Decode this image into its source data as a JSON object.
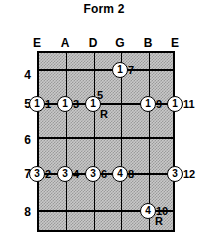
{
  "title": "Form 2",
  "diagram": {
    "type": "guitar-fretboard",
    "strings": [
      {
        "label": "E",
        "x": 37
      },
      {
        "label": "A",
        "x": 65
      },
      {
        "label": "D",
        "x": 93
      },
      {
        "label": "G",
        "x": 120
      },
      {
        "label": "B",
        "x": 148
      },
      {
        "label": "E",
        "x": 175
      }
    ],
    "frets": [
      {
        "number": "4",
        "y": 75
      },
      {
        "number": "5",
        "y": 104
      },
      {
        "number": "6",
        "y": 140
      },
      {
        "number": "7",
        "y": 174
      },
      {
        "number": "8",
        "y": 212
      }
    ],
    "fret_line_y": [
      16,
      50,
      84,
      120,
      157
    ],
    "markers": [
      {
        "finger": "1",
        "degree": "7",
        "string": 3,
        "fret": "4",
        "x": 120,
        "y": 70,
        "root": false
      },
      {
        "finger": "1",
        "degree": "1",
        "string": 0,
        "fret": "5",
        "x": 37,
        "y": 104,
        "root": false
      },
      {
        "finger": "1",
        "degree": "3",
        "string": 1,
        "fret": "5",
        "x": 65,
        "y": 104,
        "root": false
      },
      {
        "finger": "1",
        "degree": "5",
        "string": 2,
        "fret": "5",
        "x": 93,
        "y": 104,
        "root": true,
        "degree_above": true
      },
      {
        "finger": "1",
        "degree": "9",
        "string": 4,
        "fret": "5",
        "x": 148,
        "y": 104,
        "root": false
      },
      {
        "finger": "1",
        "degree": "11",
        "string": 5,
        "fret": "5",
        "x": 175,
        "y": 104,
        "root": false
      },
      {
        "finger": "3",
        "degree": "2",
        "string": 0,
        "fret": "7",
        "x": 37,
        "y": 174,
        "root": false
      },
      {
        "finger": "3",
        "degree": "4",
        "string": 1,
        "fret": "7",
        "x": 65,
        "y": 174,
        "root": false
      },
      {
        "finger": "3",
        "degree": "6",
        "string": 2,
        "fret": "7",
        "x": 93,
        "y": 174,
        "root": false
      },
      {
        "finger": "4",
        "degree": "8",
        "string": 3,
        "fret": "7",
        "x": 120,
        "y": 174,
        "root": false
      },
      {
        "finger": "3",
        "degree": "12",
        "string": 5,
        "fret": "7",
        "x": 175,
        "y": 174,
        "root": false
      },
      {
        "finger": "4",
        "degree": "10",
        "string": 4,
        "fret": "8",
        "x": 148,
        "y": 211,
        "root": true
      }
    ],
    "root_symbol": "R",
    "colors": {
      "board": "#c9c9c9",
      "board_texture": "#9a9a9a",
      "lines": "#000000",
      "dot_fill": "#ffffff",
      "text": "#000000",
      "page": "#ffffff"
    }
  }
}
